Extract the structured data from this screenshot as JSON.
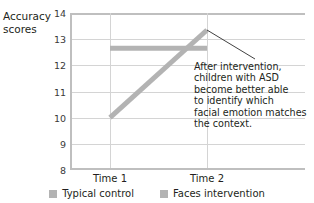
{
  "chart_data": {
    "type": "line",
    "title": "",
    "xlabel": "",
    "ylabel": "Accuracy scores",
    "ylabel_line1": "Accuracy",
    "ylabel_line2": "scores",
    "categories": [
      "Time 1",
      "Time 2"
    ],
    "ylim": [
      8,
      14
    ],
    "yticks": [
      8,
      9,
      10,
      11,
      12,
      13,
      14
    ],
    "ytick_labels": [
      "8",
      "9",
      "10",
      "11",
      "12",
      "13",
      "14"
    ],
    "grid": true,
    "legend_position": "bottom",
    "series": [
      {
        "name": "Typical control",
        "color": "#b3b3b3",
        "values": [
          12.65,
          12.65
        ]
      },
      {
        "name": "Faces intervention",
        "color": "#b3b3b3",
        "values": [
          10.0,
          13.35
        ]
      }
    ],
    "annotations": [
      {
        "text": "After intervention, children with ASD become better able to identify which facial emotion matches the context.",
        "lines": [
          "After intervention,",
          "children with ASD",
          "become better able",
          "to identify which",
          "facial emotion matches",
          "the context."
        ],
        "points_to": {
          "category": "Time 2",
          "value": 13.35
        }
      }
    ]
  },
  "colors": {
    "series": "#b3b3b3",
    "gridline": "#d4d4d4",
    "axis": "#bfbfbf",
    "text": "#231f20",
    "tick_text": "#3a3a3a",
    "leader_line": "#2b2b2b",
    "background": "#ffffff"
  }
}
